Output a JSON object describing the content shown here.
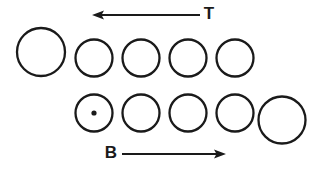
{
  "figure": {
    "width": 325,
    "height": 172,
    "background_color": "#ffffff",
    "ink_color": "#1a1a1a"
  },
  "arrows": {
    "top": {
      "label": "T",
      "direction": "left",
      "label_x": 209,
      "label_y": 15,
      "line_x1": 200,
      "line_x2": 99,
      "line_y": 15,
      "head_tip_x": 92,
      "head_tip_y": 15,
      "head_width": 12,
      "head_height": 9
    },
    "bottom": {
      "label": "B",
      "direction": "right",
      "label_x": 111,
      "label_y": 154,
      "line_x1": 122,
      "line_x2": 218,
      "line_y": 154,
      "head_tip_x": 226,
      "head_tip_y": 154,
      "head_width": 12,
      "head_height": 9
    }
  },
  "rows": [
    {
      "name": "top-row",
      "center_y": 58,
      "circles": [
        {
          "name": "top-circle-1",
          "cx": 41,
          "cy": 52,
          "r": 24,
          "stroke_width": 2.3,
          "dot": false
        },
        {
          "name": "top-circle-2",
          "cx": 94,
          "cy": 58,
          "r": 18.5,
          "stroke_width": 2.3,
          "dot": false
        },
        {
          "name": "top-circle-3",
          "cx": 141,
          "cy": 58,
          "r": 18.5,
          "stroke_width": 2.3,
          "dot": false
        },
        {
          "name": "top-circle-4",
          "cx": 188,
          "cy": 58,
          "r": 18.5,
          "stroke_width": 2.3,
          "dot": false
        },
        {
          "name": "top-circle-5",
          "cx": 235,
          "cy": 58,
          "r": 18.5,
          "stroke_width": 2.3,
          "dot": false
        }
      ]
    },
    {
      "name": "bottom-row",
      "center_y": 113,
      "circles": [
        {
          "name": "bottom-circle-1",
          "cx": 94,
          "cy": 113,
          "r": 18.5,
          "stroke_width": 2.3,
          "dot": true,
          "dot_r": 2.6
        },
        {
          "name": "bottom-circle-2",
          "cx": 141,
          "cy": 113,
          "r": 18.5,
          "stroke_width": 2.3,
          "dot": false
        },
        {
          "name": "bottom-circle-3",
          "cx": 188,
          "cy": 113,
          "r": 18.5,
          "stroke_width": 2.3,
          "dot": false
        },
        {
          "name": "bottom-circle-4",
          "cx": 235,
          "cy": 113,
          "r": 18.5,
          "stroke_width": 2.3,
          "dot": false
        },
        {
          "name": "bottom-circle-5",
          "cx": 282,
          "cy": 120,
          "r": 23.5,
          "stroke_width": 2.3,
          "dot": false
        }
      ]
    }
  ]
}
